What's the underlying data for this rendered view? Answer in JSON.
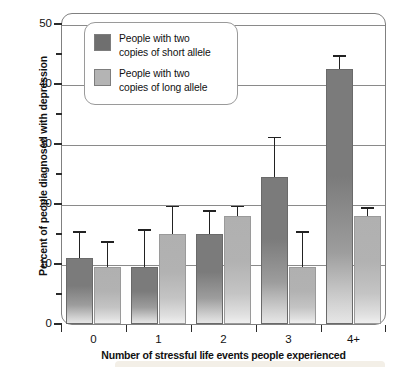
{
  "chart_data": {
    "type": "bar",
    "title": "",
    "xlabel": "Number of stressful life events people experienced",
    "ylabel": "Percent of people diagnosed with depression",
    "categories": [
      "0",
      "1",
      "2",
      "3",
      "4+"
    ],
    "ylim": [
      0,
      50
    ],
    "ytick_labels": [
      "0",
      "10",
      "20",
      "30",
      "40",
      "50"
    ],
    "ytick_values": [
      0,
      10,
      20,
      30,
      40,
      50
    ],
    "yminor_tick_values": [
      5,
      15,
      25,
      35,
      45
    ],
    "grid": true,
    "legend_position": "upper-left-inside",
    "series": [
      {
        "name": "People with two\ncopies of short allele",
        "color": "#7b7b7b",
        "values": [
          11,
          9.5,
          15,
          24.5,
          42.5
        ],
        "error_upper": [
          15.5,
          15.8,
          19,
          31.2,
          44.8
        ]
      },
      {
        "name": "People with two\ncopies of long allele",
        "color": "#b2b2b2",
        "values": [
          9.5,
          15,
          18,
          9.5,
          18
        ],
        "error_upper": [
          13.8,
          19.7,
          19.7,
          15.5,
          19.5
        ]
      }
    ]
  },
  "legend": {
    "entries": [
      {
        "label": "People with two\ncopies of short allele",
        "swatch": "dark"
      },
      {
        "label": "People with two\ncopies of long allele",
        "swatch": "light"
      }
    ]
  },
  "colors": {
    "short_allele": "#7b7b7b",
    "long_allele": "#b2b2b2",
    "grid": "#8a8a8a",
    "frame": "#808080",
    "text": "#111111"
  }
}
